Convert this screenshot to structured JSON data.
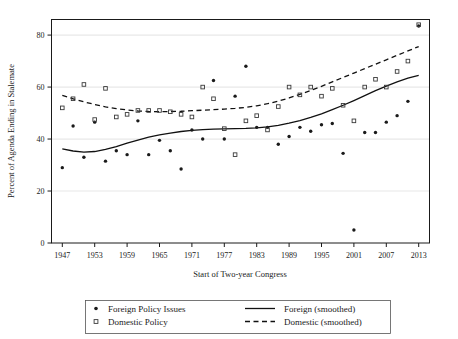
{
  "chart_data": {
    "type": "scatter",
    "title": "",
    "xlabel": "Start of Two-year Congress",
    "ylabel": "Percent of Agenda Ending in Stalemate",
    "xlim": [
      1945,
      2015
    ],
    "ylim": [
      0,
      86
    ],
    "xticks": [
      1947,
      1953,
      1959,
      1965,
      1971,
      1977,
      1983,
      1989,
      1995,
      2001,
      2007,
      2013
    ],
    "yticks": [
      0,
      20,
      40,
      60,
      80
    ],
    "gridlines": "horizontal",
    "legend_position": "below-plot",
    "series": [
      {
        "name": "Foreign Policy Issues",
        "marker": "filled-circle",
        "color": "#1a1a1a",
        "points": [
          [
            1947,
            29
          ],
          [
            1949,
            45
          ],
          [
            1951,
            33
          ],
          [
            1953,
            46.5
          ],
          [
            1955,
            31.5
          ],
          [
            1957,
            35.5
          ],
          [
            1959,
            34
          ],
          [
            1961,
            47
          ],
          [
            1963,
            34
          ],
          [
            1965,
            39.5
          ],
          [
            1967,
            35.5
          ],
          [
            1969,
            28.5
          ],
          [
            1971,
            43.5
          ],
          [
            1973,
            40
          ],
          [
            1975,
            62.5
          ],
          [
            1977,
            40
          ],
          [
            1979,
            56.5
          ],
          [
            1981,
            68
          ],
          [
            1983,
            44.5
          ],
          [
            1985,
            44.5
          ],
          [
            1987,
            38
          ],
          [
            1989,
            41
          ],
          [
            1991,
            44.5
          ],
          [
            1993,
            43
          ],
          [
            1995,
            45.5
          ],
          [
            1997,
            46
          ],
          [
            1999,
            34.5
          ],
          [
            2001,
            5
          ],
          [
            2003,
            42.5
          ],
          [
            2005,
            42.5
          ],
          [
            2007,
            46.5
          ],
          [
            2009,
            49
          ],
          [
            2011,
            54.5
          ],
          [
            2013,
            83.5
          ]
        ]
      },
      {
        "name": "Domestic Policy",
        "marker": "open-square",
        "color": "#3a3a3a",
        "points": [
          [
            1947,
            52
          ],
          [
            1949,
            55.5
          ],
          [
            1951,
            61
          ],
          [
            1953,
            47.5
          ],
          [
            1955,
            59.5
          ],
          [
            1957,
            48.5
          ],
          [
            1959,
            49.5
          ],
          [
            1961,
            51
          ],
          [
            1963,
            51
          ],
          [
            1965,
            51
          ],
          [
            1967,
            50.5
          ],
          [
            1969,
            49.5
          ],
          [
            1971,
            48.5
          ],
          [
            1973,
            60
          ],
          [
            1975,
            55.5
          ],
          [
            1977,
            44
          ],
          [
            1979,
            34
          ],
          [
            1981,
            47
          ],
          [
            1983,
            49
          ],
          [
            1985,
            43.5
          ],
          [
            1987,
            52.5
          ],
          [
            1989,
            60
          ],
          [
            1991,
            57
          ],
          [
            1993,
            60
          ],
          [
            1995,
            56.5
          ],
          [
            1997,
            59.5
          ],
          [
            1999,
            53
          ],
          [
            2001,
            47
          ],
          [
            2003,
            60
          ],
          [
            2005,
            63
          ],
          [
            2007,
            60
          ],
          [
            2009,
            66
          ],
          [
            2011,
            70
          ],
          [
            2013,
            84
          ]
        ]
      }
    ],
    "smoothed": [
      {
        "name": "Foreign (smoothed)",
        "style": "solid",
        "color": "#111111",
        "points": [
          [
            1947,
            36.2
          ],
          [
            1949,
            35.4
          ],
          [
            1951,
            35.0
          ],
          [
            1953,
            35.2
          ],
          [
            1955,
            36.0
          ],
          [
            1957,
            37.1
          ],
          [
            1959,
            38.4
          ],
          [
            1961,
            39.6
          ],
          [
            1963,
            40.7
          ],
          [
            1965,
            41.6
          ],
          [
            1967,
            42.3
          ],
          [
            1969,
            42.9
          ],
          [
            1971,
            43.3
          ],
          [
            1973,
            43.6
          ],
          [
            1975,
            43.8
          ],
          [
            1977,
            43.9
          ],
          [
            1979,
            44.0
          ],
          [
            1981,
            44.1
          ],
          [
            1983,
            44.3
          ],
          [
            1985,
            44.7
          ],
          [
            1987,
            45.3
          ],
          [
            1989,
            46.1
          ],
          [
            1991,
            47.1
          ],
          [
            1993,
            48.3
          ],
          [
            1995,
            49.7
          ],
          [
            1997,
            51.3
          ],
          [
            1999,
            53.0
          ],
          [
            2001,
            54.8
          ],
          [
            2003,
            56.7
          ],
          [
            2005,
            58.6
          ],
          [
            2007,
            60.4
          ],
          [
            2009,
            62.0
          ],
          [
            2011,
            63.4
          ],
          [
            2013,
            64.5
          ]
        ]
      },
      {
        "name": "Domestic (smoothed)",
        "style": "dashed",
        "color": "#111111",
        "points": [
          [
            1947,
            56.8
          ],
          [
            1949,
            55.5
          ],
          [
            1951,
            54.3
          ],
          [
            1953,
            53.3
          ],
          [
            1955,
            52.4
          ],
          [
            1957,
            51.7
          ],
          [
            1959,
            51.2
          ],
          [
            1961,
            50.8
          ],
          [
            1963,
            50.6
          ],
          [
            1965,
            50.5
          ],
          [
            1967,
            50.6
          ],
          [
            1969,
            50.7
          ],
          [
            1971,
            50.9
          ],
          [
            1973,
            51.1
          ],
          [
            1975,
            51.3
          ],
          [
            1977,
            51.5
          ],
          [
            1979,
            51.8
          ],
          [
            1981,
            52.2
          ],
          [
            1983,
            52.8
          ],
          [
            1985,
            53.6
          ],
          [
            1987,
            54.6
          ],
          [
            1989,
            55.8
          ],
          [
            1991,
            57.2
          ],
          [
            1993,
            58.7
          ],
          [
            1995,
            60.3
          ],
          [
            1997,
            62.0
          ],
          [
            1999,
            63.7
          ],
          [
            2001,
            65.4
          ],
          [
            2003,
            67.1
          ],
          [
            2005,
            68.8
          ],
          [
            2007,
            70.5
          ],
          [
            2009,
            72.2
          ],
          [
            2011,
            73.9
          ],
          [
            2013,
            75.6
          ]
        ]
      }
    ],
    "legend": [
      {
        "label": "Foreign Policy Issues",
        "symbol": "filled-circle"
      },
      {
        "label": "Domestic Policy",
        "symbol": "open-square"
      },
      {
        "label": "Foreign (smoothed)",
        "symbol": "solid-line"
      },
      {
        "label": "Domestic (smoothed)",
        "symbol": "dashed-line"
      }
    ]
  },
  "colors": {
    "background": "#ffffff",
    "frame": "#1a1a1a",
    "grid": "#e8e8e8",
    "foreign": "#1a1a1a",
    "domestic": "#3a3a3a"
  }
}
